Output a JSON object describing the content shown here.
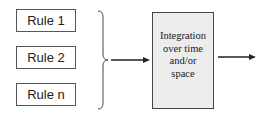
{
  "diagram": {
    "inputs": [
      {
        "label": "Rule 1"
      },
      {
        "label": "Rule 2"
      },
      {
        "label": "Rule n"
      }
    ],
    "process": {
      "lines": [
        "Integration",
        "over time",
        "and/or",
        "space"
      ],
      "fill_color": "#ececec"
    },
    "connectors": [
      {
        "type": "brace",
        "groups": [
          "Rule 1",
          "Rule 2",
          "Rule n"
        ]
      },
      {
        "type": "arrow",
        "from": "brace",
        "to": "process"
      },
      {
        "type": "arrow",
        "from": "process",
        "to": "output"
      }
    ]
  }
}
